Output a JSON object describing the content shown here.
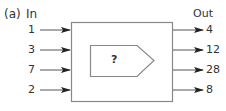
{
  "figure": {
    "label": "(a)",
    "in_header": "In",
    "out_header": "Out",
    "machine_label": "?",
    "inputs": [
      "1",
      "3",
      "7",
      "2"
    ],
    "outputs": [
      "4",
      "12",
      "28",
      "8"
    ],
    "colors": {
      "stroke": "#777777",
      "arrow": "#222222",
      "text": "#333333"
    }
  }
}
